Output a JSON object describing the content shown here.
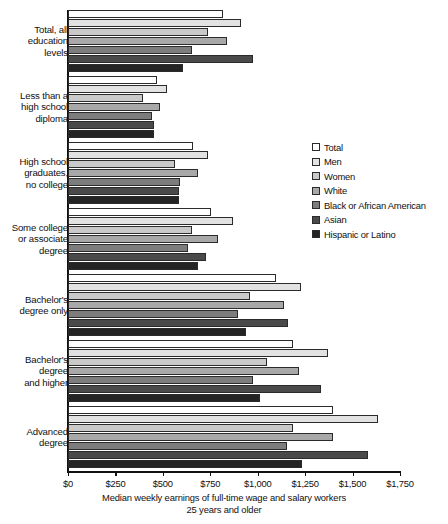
{
  "chart_data": {
    "type": "bar",
    "orientation": "horizontal",
    "title": "",
    "xlabel": "Median weekly earnings of full-time wage and salary workers",
    "xlabel_line2": "25 years and older",
    "ylabel": "",
    "xlim": [
      0,
      1750
    ],
    "xticks": [
      0,
      250,
      500,
      750,
      1000,
      1250,
      1500,
      1750
    ],
    "xtick_labels": [
      "$0",
      "$250",
      "$500",
      "$750",
      "$1,000",
      "$1,250",
      "$1,500",
      "$1,750"
    ],
    "grid": false,
    "legend_position": "right-middle",
    "categories": [
      "Total, all education levels",
      "Less than a high school diploma",
      "High school graduates, no college",
      "Some college or associate degree",
      "Bachelor's degree only",
      "Bachelor's degree and higher",
      "Advanced degree"
    ],
    "category_label_lines": [
      [
        "Total, all",
        "education",
        "levels"
      ],
      [
        "Less than a",
        "high school",
        "diploma"
      ],
      [
        "High school",
        "graduates,",
        "no college"
      ],
      [
        "Some college",
        "or associate",
        "degree"
      ],
      [
        "Bachelor's",
        "degree only"
      ],
      [
        "Bachelor's",
        "degree",
        "and higher"
      ],
      [
        "Advanced",
        "degree"
      ]
    ],
    "series": [
      {
        "name": "Total",
        "color": "#ffffff",
        "values": [
          817,
          470,
          659,
          754,
          1099,
          1187,
          1398
        ]
      },
      {
        "name": "Men",
        "color": "#e2e2e2",
        "values": [
          912,
          522,
          738,
          870,
          1230,
          1372,
          1636
        ]
      },
      {
        "name": "Women",
        "color": "#c9c9c9",
        "values": [
          738,
          396,
          564,
          654,
          961,
          1049,
          1187
        ]
      },
      {
        "name": "White",
        "color": "#a8a8a8",
        "values": [
          838,
          485,
          686,
          792,
          1136,
          1218,
          1398
        ]
      },
      {
        "name": "Black or African American",
        "color": "#7d7d7d",
        "values": [
          654,
          443,
          591,
          633,
          897,
          976,
          1155
        ]
      },
      {
        "name": "Asian",
        "color": "#4a4a4a",
        "values": [
          976,
          454,
          586,
          728,
          1162,
          1335,
          1583
        ]
      },
      {
        "name": "Hispanic or Latino",
        "color": "#242424",
        "values": [
          605,
          454,
          586,
          686,
          940,
          1013,
          1235
        ]
      }
    ]
  },
  "legend": {
    "items": [
      {
        "label": "Total"
      },
      {
        "label": "Men"
      },
      {
        "label": "Women"
      },
      {
        "label": "White"
      },
      {
        "label": "Black or African American"
      },
      {
        "label": "Asian"
      },
      {
        "label": "Hispanic or Latino"
      }
    ]
  }
}
